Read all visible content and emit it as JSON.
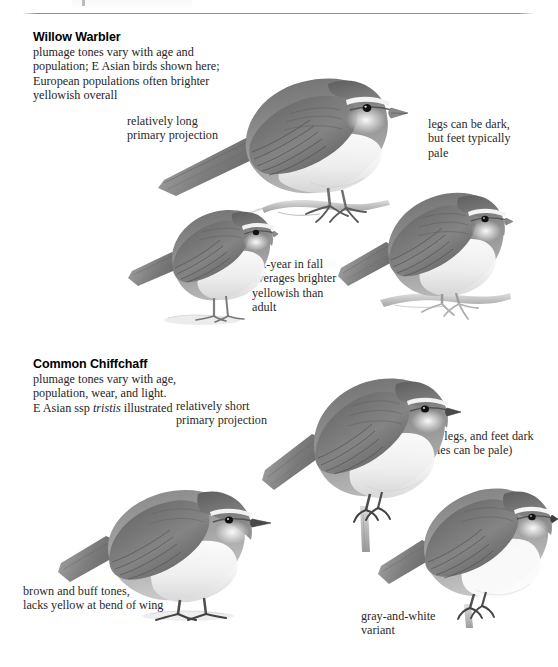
{
  "page": {
    "type": "field-guide-plate",
    "background": "#ffffff",
    "ink": "#1a1a1a",
    "has_top_rule": true
  },
  "species": [
    {
      "id": "willow-warbler",
      "name": "Willow Warbler",
      "description": "plumage tones vary with age and\npopulation; E Asian birds shown here;\nEuropean populations often brighter\nyellowish overall",
      "callouts": [
        {
          "id": "primary-projection",
          "text": "relatively long\nprimary projection",
          "align": "left"
        },
        {
          "id": "legs-feet",
          "text": "legs can be dark,\nbut feet typically\npale",
          "align": "left"
        },
        {
          "id": "first-year",
          "text": "1st-year in fall\naverages brighter\nyellowish than\nadult",
          "align": "left"
        }
      ],
      "figures": [
        {
          "id": "willow-warbler-adult-perched",
          "pose": "perched on branch, large, facing right"
        },
        {
          "id": "willow-warbler-first-year",
          "pose": "standing, facing right"
        },
        {
          "id": "willow-warbler-adult-right",
          "pose": "perched on branch, facing right"
        }
      ]
    },
    {
      "id": "common-chiffchaff",
      "name": "Common Chiffchaff",
      "description_pre": "plumage tones vary with age,\npopulation, wear, and light.\nE Asian ssp ",
      "description_italic": "tristis",
      "description_post": " illustrated",
      "callouts": [
        {
          "id": "primary-projection",
          "text": "relatively short\nprimary projection",
          "align": "left"
        },
        {
          "id": "bill-legs-feet",
          "text": "bill, legs, and feet dark\n(soles can be pale)",
          "align": "left"
        },
        {
          "id": "brown-buff",
          "text": "brown and buff tones,\nlacks yellow at bend of wing",
          "align": "left"
        },
        {
          "id": "gray-and-white",
          "text": "gray-and-white\nvariant",
          "align": "left"
        }
      ],
      "figures": [
        {
          "id": "chiffchaff-perched-branch",
          "pose": "perched on vertical twig, facing right"
        },
        {
          "id": "chiffchaff-brown-buff",
          "pose": "standing, facing right"
        },
        {
          "id": "chiffchaff-gray-white",
          "pose": "perched, facing right"
        }
      ]
    }
  ]
}
